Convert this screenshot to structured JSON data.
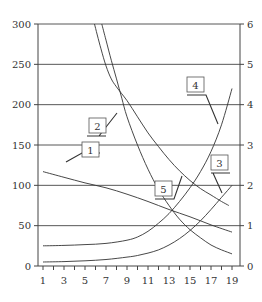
{
  "chart_data": {
    "type": "line",
    "title": "",
    "xlabel": "",
    "ylabel": "",
    "y2label": "",
    "x_ticks": [
      1,
      3,
      5,
      7,
      9,
      11,
      13,
      15,
      17,
      19
    ],
    "x_range": [
      0.5,
      19.8
    ],
    "ylim": [
      0,
      300
    ],
    "y_ticks": [
      0,
      50,
      100,
      150,
      200,
      250,
      300
    ],
    "y2lim": [
      0,
      6
    ],
    "y2_ticks": [
      0,
      1,
      2,
      3,
      4,
      5,
      6
    ],
    "grid": "horizontal",
    "series": [
      {
        "name": "1",
        "axis": "left",
        "x": [
          1,
          3,
          5,
          7,
          9,
          11,
          13,
          15,
          17,
          19
        ],
        "values": [
          117,
          110,
          103,
          97,
          89,
          80,
          70,
          61,
          51,
          42
        ]
      },
      {
        "name": "2a",
        "axis": "left",
        "x": [
          5.9,
          6.5,
          7,
          7.5,
          8,
          9,
          10,
          11,
          12,
          13,
          14,
          15,
          16,
          17,
          18,
          18.7
        ],
        "values": [
          300,
          270,
          248,
          232,
          222,
          205,
          185,
          165,
          148,
          132,
          118,
          106,
          96,
          88,
          80,
          75
        ]
      },
      {
        "name": "2b",
        "axis": "left",
        "x": [
          6.6,
          7,
          7.5,
          8,
          8.5,
          9,
          10,
          11,
          12,
          13,
          14,
          15,
          16,
          17,
          18,
          19
        ],
        "values": [
          300,
          280,
          255,
          232,
          208,
          185,
          150,
          120,
          95,
          75,
          58,
          45,
          35,
          26,
          20,
          15
        ]
      },
      {
        "name": "3",
        "axis": "left",
        "x": [
          1,
          3,
          5,
          7,
          9,
          10,
          11,
          12,
          13,
          14,
          15,
          16,
          17,
          18,
          19
        ],
        "values": [
          5,
          5.5,
          6.5,
          8,
          11,
          13,
          16,
          20,
          26,
          34,
          44,
          56,
          70,
          85,
          100
        ]
      },
      {
        "name": "4",
        "axis": "left",
        "x": [
          1,
          3,
          5,
          7,
          9,
          10,
          11,
          12,
          13,
          14,
          15,
          16,
          17,
          18,
          19
        ],
        "values": [
          25,
          25.5,
          26.5,
          28,
          32,
          36,
          43,
          53,
          65,
          80,
          97,
          117,
          142,
          175,
          220
        ]
      }
    ],
    "annotations": [
      {
        "label": "1",
        "target_x": 3.0,
        "target_y": 110
      },
      {
        "label": "2",
        "target_x": 8.5,
        "target_y": 188
      },
      {
        "label": "3",
        "target_x": 17.6,
        "target_y": 85
      },
      {
        "label": "4",
        "target_x": 17.6,
        "target_y": 175
      },
      {
        "label": "5",
        "target_x": 13.8,
        "target_y": 118
      }
    ]
  }
}
